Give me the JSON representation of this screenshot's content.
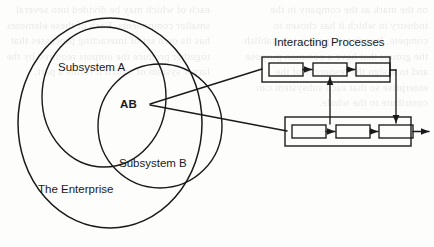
{
  "figure": {
    "type": "venn-and-process-flow-diagram",
    "background_color": "#fdfdfc",
    "stroke_color": "#1a1a1a",
    "labels": {
      "enterprise": "The Enterprise",
      "subsystem_a": "Subsystem A",
      "subsystem_b": "Subsystem B",
      "intersection": "AB",
      "interacting_processes": "Interacting Processes"
    },
    "venn": {
      "enterprise_ellipse": {
        "cx": 110,
        "cy": 123,
        "rx": 92,
        "ry": 105
      },
      "subsystem_a_ellipse": {
        "cx": 104,
        "cy": 97,
        "rx": 62,
        "ry": 70
      },
      "subsystem_b_ellipse": {
        "cx": 160,
        "cy": 126,
        "rx": 62,
        "ry": 62
      }
    },
    "process_groups": [
      {
        "name": "top-process-group",
        "outer_box": {
          "x": 262,
          "y": 57,
          "width": 128,
          "height": 25
        },
        "boxes": [
          {
            "x": 269,
            "y": 63,
            "width": 34,
            "height": 13
          },
          {
            "x": 313,
            "y": 63,
            "width": 34,
            "height": 13
          },
          {
            "x": 356,
            "y": 63,
            "width": 34,
            "height": 13
          }
        ]
      },
      {
        "name": "bottom-process-group",
        "outer_box": {
          "x": 285,
          "y": 117,
          "width": 126,
          "height": 29
        },
        "boxes": [
          {
            "x": 292,
            "y": 125,
            "width": 34,
            "height": 13
          },
          {
            "x": 336,
            "y": 125,
            "width": 34,
            "height": 13
          },
          {
            "x": 379,
            "y": 125,
            "width": 34,
            "height": 13
          }
        ]
      }
    ],
    "connectors": [
      {
        "name": "ab-to-top-group",
        "from": [
          148,
          104
        ],
        "to": [
          262,
          69
        ]
      },
      {
        "name": "ab-to-bottom-group",
        "from": [
          148,
          104
        ],
        "to": [
          285,
          131
        ]
      },
      {
        "name": "bottom-to-top-feedback",
        "direction": "up",
        "from": [
          330,
          133
        ],
        "to": [
          330,
          79
        ]
      },
      {
        "name": "top-to-bottom-feedback",
        "direction": "down",
        "from": [
          396,
          70
        ],
        "to": [
          396,
          122
        ]
      },
      {
        "name": "bottom-group-output",
        "direction": "right",
        "from": [
          411,
          131
        ],
        "to": [
          428,
          131
        ]
      }
    ]
  },
  "bleed_text": {
    "left_column": "on the mark as the company in the industry in which it has chosen to compete. Its primary goal is to establish the groups that have a common purpose and to assign the resources of the enterprise so that each subsystem can contribute to the whole.",
    "right_column": "each of which may be divided into several smaller components. Each of these elements has its own set of interacting processes that together produce the outputs required by the larger system of which it forms a part."
  }
}
